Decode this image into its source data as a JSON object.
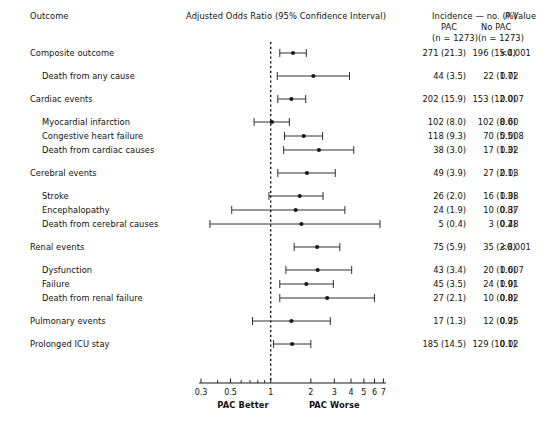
{
  "header": {
    "outcome_label": "Outcome",
    "axis_title": "Adjusted Odds Ratio (95% Confidence Interval)",
    "incidence_title": "Incidence — no. (%)",
    "p_value_title": "P Value",
    "p_value_italic": "P",
    "p_value_rest": " Value",
    "group1_label": "PAC",
    "group2_label": "No PAC",
    "group1_n": "(n = 1273)",
    "group2_n": "(n = 1273)"
  },
  "axis": {
    "left_caption": "PAC Better",
    "right_caption": "PAC Worse",
    "ticks": [
      "0.3",
      "0.5",
      "1",
      "2",
      "3",
      "4",
      "5",
      "6",
      "7"
    ],
    "tick_values": [
      0.3,
      0.5,
      1,
      2,
      3,
      4,
      5,
      6,
      7
    ],
    "minor_ticks": [
      0.4,
      0.6,
      0.7,
      0.8,
      0.9
    ],
    "scale": "log",
    "xmin": 0.3,
    "xmax": 7.2,
    "reference_line": 1.0,
    "left_caption_value": 0.62,
    "right_caption_value": 3.0
  },
  "chart_data": {
    "type": "forest",
    "title": "Adjusted Odds Ratio (95% Confidence Interval)",
    "xlabel": "Adjusted Odds Ratio",
    "ylabel": "Outcome",
    "xlim": [
      0.3,
      7.2
    ],
    "xscale": "log",
    "reference_line": 1.0,
    "grid": false,
    "legend": "none",
    "columns": [
      "Outcome",
      "Adjusted Odds Ratio (95% Confidence Interval)",
      "PAC (n = 1273)",
      "No PAC (n = 1273)",
      "P Value"
    ],
    "rows": [
      {
        "label": "Composite outcome",
        "indent": 0,
        "or": 1.47,
        "lo": 1.17,
        "hi": 1.85,
        "pac": "271 (21.3)",
        "nopac": "196 (15.4)",
        "p": "<0.001",
        "spacer_before": 0
      },
      {
        "label": "Death from any cause",
        "indent": 1,
        "or": 2.09,
        "lo": 1.12,
        "hi": 3.9,
        "pac": "44 (3.5)",
        "nopac": "22 (1.7)",
        "p": "0.02",
        "spacer_before": 1
      },
      {
        "label": "Cardiac events",
        "indent": 0,
        "or": 1.43,
        "lo": 1.13,
        "hi": 1.83,
        "pac": "202 (15.9)",
        "nopac": "153 (12.0)",
        "p": "0.007",
        "spacer_before": 1
      },
      {
        "label": "Myocardial infarction",
        "indent": 1,
        "or": 1.02,
        "lo": 0.75,
        "hi": 1.38,
        "pac": "102 (8.0)",
        "nopac": "102 (8.0)",
        "p": "0.60",
        "spacer_before": 1
      },
      {
        "label": "Congestive heart failure",
        "indent": 1,
        "or": 1.77,
        "lo": 1.27,
        "hi": 2.45,
        "pac": "118 (9.3)",
        "nopac": "70 (5.5)",
        "p": "0.008",
        "spacer_before": 0
      },
      {
        "label": "Death from cardiac causes",
        "indent": 1,
        "or": 2.3,
        "lo": 1.25,
        "hi": 4.2,
        "pac": "38 (3.0)",
        "nopac": "17 (1.3)",
        "p": "0.02",
        "spacer_before": 0
      },
      {
        "label": "Cerebral events",
        "indent": 0,
        "or": 1.87,
        "lo": 1.13,
        "hi": 3.05,
        "pac": "49 (3.9)",
        "nopac": "27 (2.1)",
        "p": "0.03",
        "spacer_before": 1
      },
      {
        "label": "Stroke",
        "indent": 1,
        "or": 1.65,
        "lo": 0.97,
        "hi": 2.47,
        "pac": "26 (2.0)",
        "nopac": "16 (1.3)",
        "p": "0.08",
        "spacer_before": 1
      },
      {
        "label": "Encephalopathy",
        "indent": 1,
        "or": 1.54,
        "lo": 0.51,
        "hi": 3.6,
        "pac": "24 (1.9)",
        "nopac": "10 (0.8)",
        "p": "0.37",
        "spacer_before": 0
      },
      {
        "label": "Death from cerebral causes",
        "indent": 1,
        "or": 1.7,
        "lo": 0.35,
        "hi": 6.6,
        "pac": "5 (0.4)",
        "nopac": "3 (0.2)",
        "p": "0.48",
        "spacer_before": 0
      },
      {
        "label": "Renal events",
        "indent": 0,
        "or": 2.23,
        "lo": 1.5,
        "hi": 3.3,
        "pac": "75 (5.9)",
        "nopac": "35 (2.8)",
        "p": "<0.001",
        "spacer_before": 1
      },
      {
        "label": "Dysfunction",
        "indent": 1,
        "or": 2.25,
        "lo": 1.3,
        "hi": 4.05,
        "pac": "43 (3.4)",
        "nopac": "20 (1.6)",
        "p": "0.007",
        "spacer_before": 1
      },
      {
        "label": "Failure",
        "indent": 1,
        "or": 1.85,
        "lo": 1.17,
        "hi": 2.95,
        "pac": "45 (3.5)",
        "nopac": "24 (1.9)",
        "p": "0.01",
        "spacer_before": 0
      },
      {
        "label": "Death from renal failure",
        "indent": 1,
        "or": 2.65,
        "lo": 1.17,
        "hi": 6.0,
        "pac": "27 (2.1)",
        "nopac": "10 (0.8)",
        "p": "0.02",
        "spacer_before": 0
      },
      {
        "label": "Pulmonary events",
        "indent": 0,
        "or": 1.43,
        "lo": 0.73,
        "hi": 2.8,
        "pac": "17 (1.3)",
        "nopac": "12 (0.9)",
        "p": "0.25",
        "spacer_before": 1
      },
      {
        "label": "Prolonged ICU stay",
        "indent": 0,
        "or": 1.45,
        "lo": 1.05,
        "hi": 2.0,
        "pac": "185 (14.5)",
        "nopac": "129 (10.1)",
        "p": "0.02",
        "spacer_before": 1
      }
    ]
  }
}
